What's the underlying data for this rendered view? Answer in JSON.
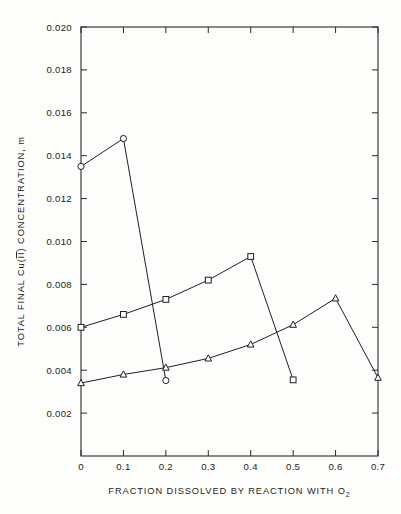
{
  "figure": {
    "background_color": "#fdfdfb",
    "line_color": "#1f1f1f",
    "marker_fill": "#fdfdfb"
  },
  "axes": {
    "x_title": "FRACTION DISSOLVED BY REACTION WITH O",
    "x_title_subscript": "2",
    "y_title_part1": "TOTAL FINAL Cu(",
    "y_title_roman": "II",
    "y_title_part2": ") CONCENTRATION, m",
    "x_tick_labels": [
      "0",
      "0.1",
      "0.2",
      "0.3",
      "0.4",
      "0.5",
      "0.6",
      "0.7"
    ],
    "y_tick_labels": [
      "0.002",
      "0.004",
      "0.006",
      "0.008",
      "0.010",
      "0.012",
      "0.014",
      "0.016",
      "0.018",
      "0.020"
    ]
  },
  "chart_data": {
    "type": "line",
    "title": "",
    "xlabel": "FRACTION DISSOLVED BY REACTION WITH O2",
    "ylabel": "TOTAL FINAL Cu(II) CONCENTRATION, m",
    "xlim": [
      0,
      0.7
    ],
    "ylim": [
      0,
      0.02
    ],
    "x_tick_values": [
      0,
      0.1,
      0.2,
      0.3,
      0.4,
      0.5,
      0.6,
      0.7
    ],
    "y_tick_values": [
      0.002,
      0.004,
      0.006,
      0.008,
      0.01,
      0.012,
      0.014,
      0.016,
      0.018,
      0.02
    ],
    "grid": false,
    "legend": "none",
    "series": [
      {
        "name": "circle-series",
        "marker": "circle",
        "x": [
          0,
          0.1,
          0.2
        ],
        "values": [
          0.0135,
          0.0148,
          0.00352
        ]
      },
      {
        "name": "square-series",
        "marker": "square",
        "x": [
          0,
          0.1,
          0.2,
          0.3,
          0.4,
          0.5
        ],
        "values": [
          0.006,
          0.0066,
          0.0073,
          0.0082,
          0.0093,
          0.00355
        ]
      },
      {
        "name": "triangle-series",
        "marker": "triangle",
        "x": [
          0,
          0.1,
          0.2,
          0.3,
          0.4,
          0.5,
          0.6,
          0.7
        ],
        "values": [
          0.0034,
          0.0038,
          0.00412,
          0.00455,
          0.0052,
          0.00612,
          0.00735,
          0.00365
        ]
      }
    ]
  }
}
